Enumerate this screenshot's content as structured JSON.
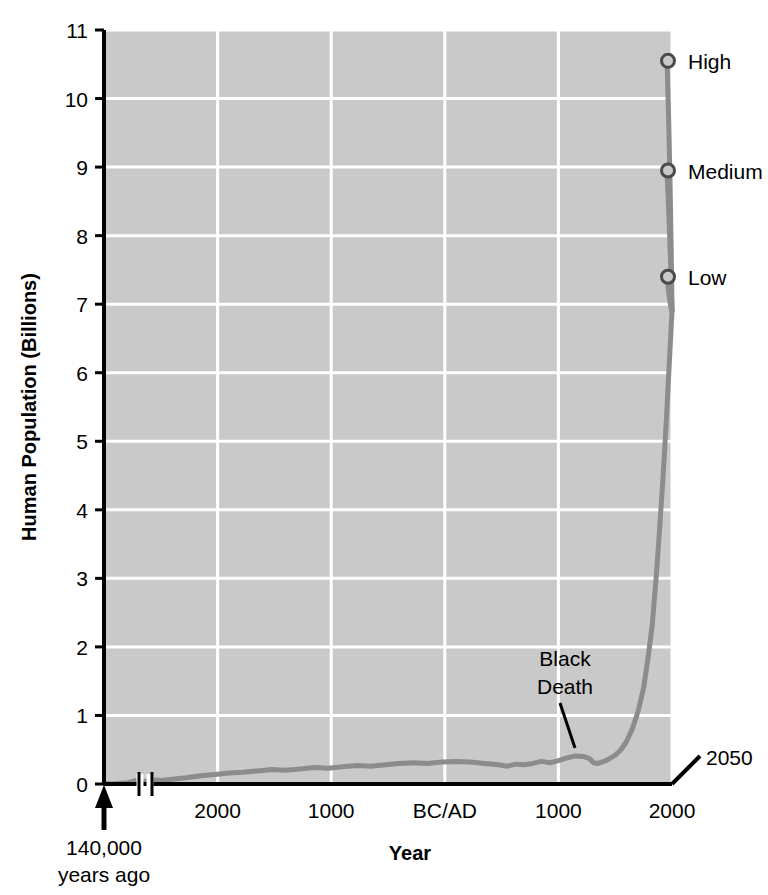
{
  "chart_data": {
    "type": "line",
    "title": "",
    "xlabel": "Year",
    "ylabel": "Human Population (Billions)",
    "ylim": [
      0,
      11
    ],
    "yticks": [
      0,
      1,
      2,
      3,
      4,
      5,
      6,
      7,
      8,
      9,
      10,
      11
    ],
    "ytick_labels": [
      "0",
      "1",
      "2",
      "3",
      "4",
      "5",
      "6",
      "7",
      "8",
      "9",
      "10",
      "11"
    ],
    "xtick_labels": [
      "2000",
      "1000",
      "BC/AD",
      "1000",
      "2000"
    ],
    "xtick_meaning": [
      "2000 BC",
      "1000 BC",
      "BC/AD",
      "1000 AD",
      "2000 AD"
    ],
    "grid": true,
    "legend_position": "right-inline-labels",
    "axis_break_note": "scale break between 140,000 years ago and about 3000 BC",
    "origin_annotation_line1": "140,000",
    "origin_annotation_line2": "years ago",
    "end_year_label": "2050",
    "annotations": [
      {
        "label_line1": "Black",
        "label_line2": "Death",
        "year": 1350,
        "value": 0.37
      }
    ],
    "series": [
      {
        "name": "Historical population",
        "color": "#8c8c8c",
        "points": [
          [
            0,
            0.004
          ],
          [
            0.18,
            0.006
          ],
          [
            0.3,
            0.012
          ],
          [
            0.42,
            0.02
          ],
          [
            0.55,
            0.05
          ],
          [
            0.68,
            0.03
          ],
          [
            0.8,
            0.05
          ],
          [
            0.92,
            0.06
          ],
          [
            1.0,
            0.05
          ],
          [
            1.2,
            0.07
          ],
          [
            1.45,
            0.09
          ],
          [
            1.7,
            0.12
          ],
          [
            1.95,
            0.14
          ],
          [
            2.2,
            0.16
          ],
          [
            2.45,
            0.17
          ],
          [
            2.7,
            0.19
          ],
          [
            2.95,
            0.21
          ],
          [
            3.2,
            0.2
          ],
          [
            3.45,
            0.22
          ],
          [
            3.7,
            0.24
          ],
          [
            3.95,
            0.23
          ],
          [
            4.2,
            0.25
          ],
          [
            4.45,
            0.27
          ],
          [
            4.7,
            0.26
          ],
          [
            4.95,
            0.28
          ],
          [
            5.2,
            0.3
          ],
          [
            5.45,
            0.31
          ],
          [
            5.7,
            0.3
          ],
          [
            5.95,
            0.32
          ],
          [
            6.2,
            0.33
          ],
          [
            6.45,
            0.32
          ],
          [
            6.7,
            0.3
          ],
          [
            6.95,
            0.28
          ],
          [
            7.1,
            0.26
          ],
          [
            7.25,
            0.29
          ],
          [
            7.4,
            0.28
          ],
          [
            7.55,
            0.3
          ],
          [
            7.7,
            0.33
          ],
          [
            7.85,
            0.31
          ],
          [
            8.0,
            0.34
          ],
          [
            8.15,
            0.38
          ],
          [
            8.3,
            0.41
          ],
          [
            8.45,
            0.4
          ],
          [
            8.55,
            0.37
          ],
          [
            8.62,
            0.31
          ],
          [
            8.7,
            0.3
          ],
          [
            8.8,
            0.33
          ],
          [
            8.9,
            0.37
          ],
          [
            9.0,
            0.42
          ],
          [
            9.1,
            0.5
          ],
          [
            9.2,
            0.62
          ],
          [
            9.3,
            0.8
          ],
          [
            9.4,
            1.05
          ],
          [
            9.5,
            1.4
          ],
          [
            9.58,
            1.85
          ],
          [
            9.65,
            2.3
          ],
          [
            9.72,
            3.0
          ],
          [
            9.78,
            3.7
          ],
          [
            9.84,
            4.45
          ],
          [
            9.9,
            5.3
          ],
          [
            9.95,
            6.1
          ],
          [
            10.0,
            6.9
          ]
        ],
        "note": "x is a positional index across the broken time axis, not a linear year"
      },
      {
        "name": "High",
        "color": "#8c8c8c",
        "projection_value": 10.55,
        "projection_year": 2050,
        "marker": "open-circle"
      },
      {
        "name": "Medium",
        "color": "#8c8c8c",
        "projection_value": 8.95,
        "projection_year": 2050,
        "marker": "open-circle"
      },
      {
        "name": "Low",
        "color": "#8c8c8c",
        "projection_value": 7.4,
        "projection_year": 2050,
        "marker": "open-circle"
      }
    ],
    "colors": {
      "plot_background": "#c9c9c9",
      "gridline": "#ffffff",
      "axis": "#000000",
      "curve": "#8c8c8c",
      "text": "#000000"
    }
  }
}
